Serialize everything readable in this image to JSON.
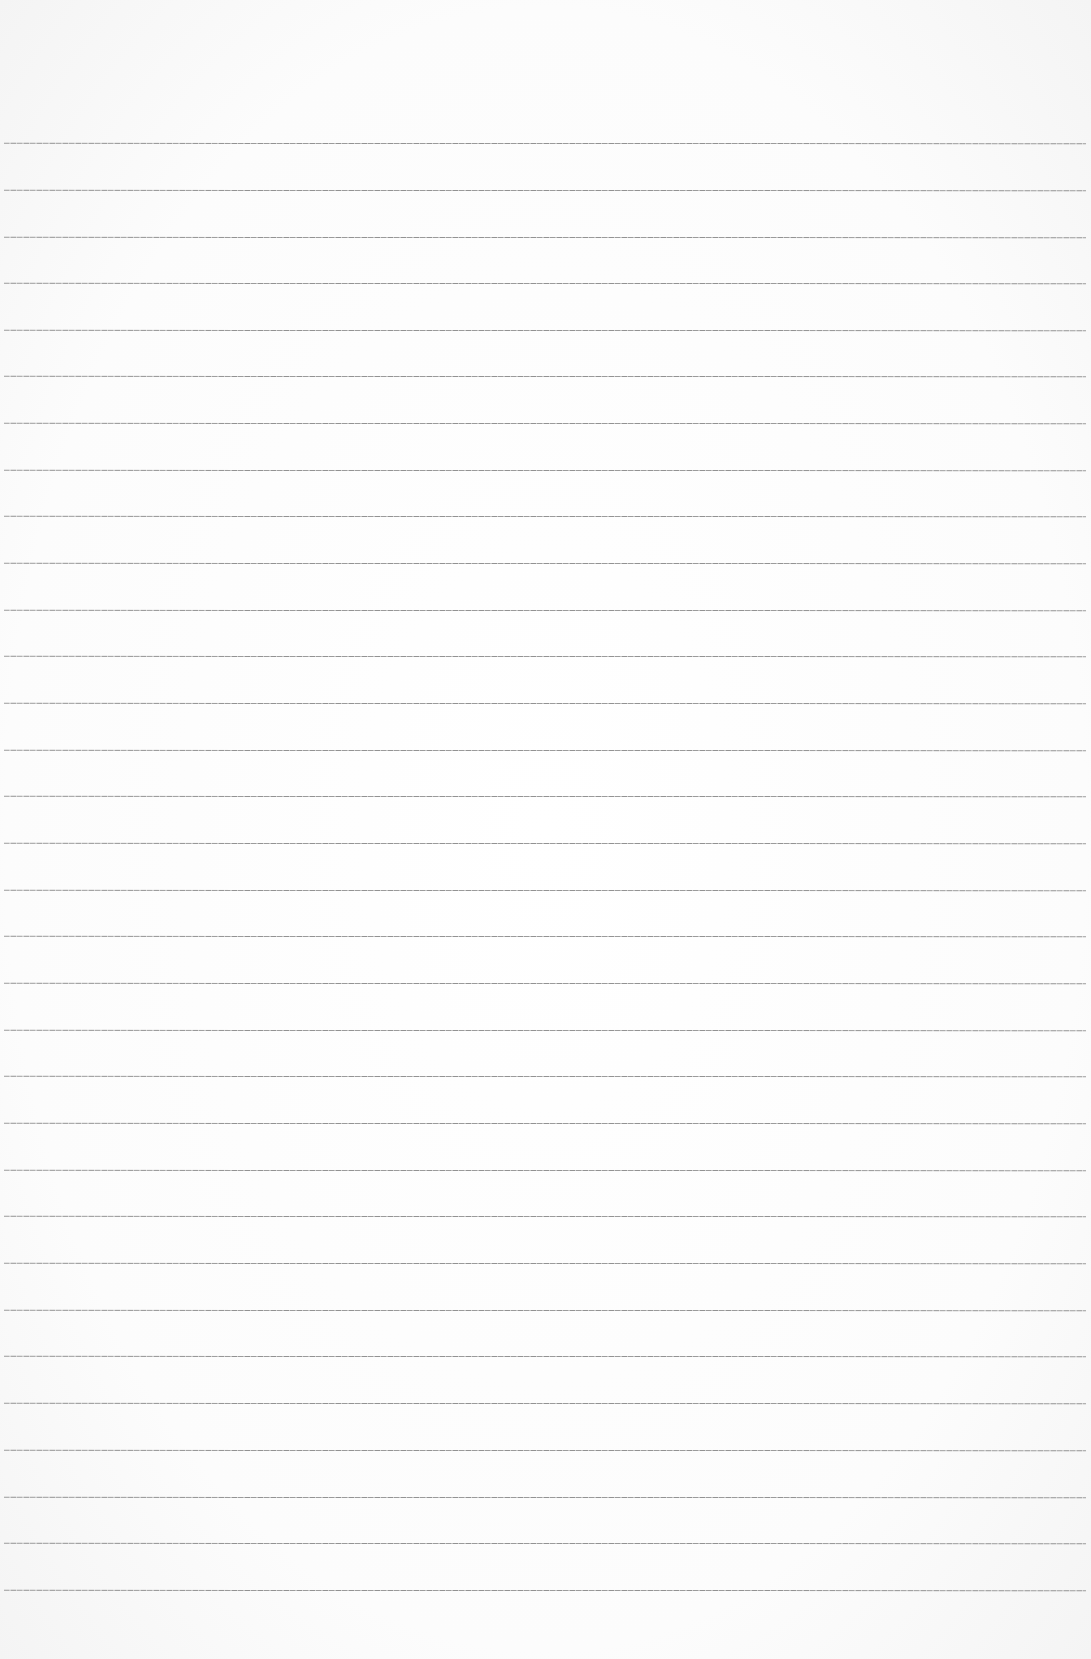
{
  "page": {
    "type": "ruled-paper",
    "background_color": "#fdfdfd",
    "rule_color": "#8a8a8a",
    "rule_count": 32,
    "rule_start_y": 143,
    "rule_spacing": 46.75,
    "rules": [
      143,
      190,
      237,
      283,
      330,
      376,
      423,
      470,
      516,
      563,
      610,
      656,
      703,
      750,
      796,
      843,
      890,
      936,
      983,
      1030,
      1076,
      1123,
      1170,
      1216,
      1263,
      1310,
      1356,
      1403,
      1450,
      1497,
      1543,
      1590
    ]
  }
}
